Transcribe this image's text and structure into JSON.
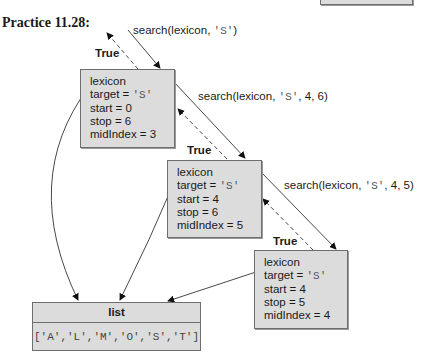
{
  "title": "Practice 11.28:",
  "calls": [
    {
      "prefix": "search(lexicon, ",
      "target": "'S'",
      "suffix": ")"
    },
    {
      "prefix": "search(lexicon, ",
      "target": "'S'",
      "suffix": ", 4, 6)"
    },
    {
      "prefix": "search(lexicon, ",
      "target": "'S'",
      "suffix": ", 4, 5)"
    }
  ],
  "returns": [
    "True",
    "True",
    "True"
  ],
  "frames": [
    {
      "lexicon": "lexicon",
      "target_label": "target = ",
      "target": "'S'",
      "start": "start = 0",
      "stop": "stop = 6",
      "mid": "midIndex = 3"
    },
    {
      "lexicon": "lexicon",
      "target_label": "target = ",
      "target": "'S'",
      "start": "start = 4",
      "stop": "stop = 6",
      "mid": "midIndex = 5"
    },
    {
      "lexicon": "lexicon",
      "target_label": "target = ",
      "target": "'S'",
      "start": "start = 4",
      "stop": "stop = 5",
      "mid": "midIndex = 4"
    }
  ],
  "list": {
    "header": "list",
    "value": "['A','L','M','O','S','T']"
  }
}
